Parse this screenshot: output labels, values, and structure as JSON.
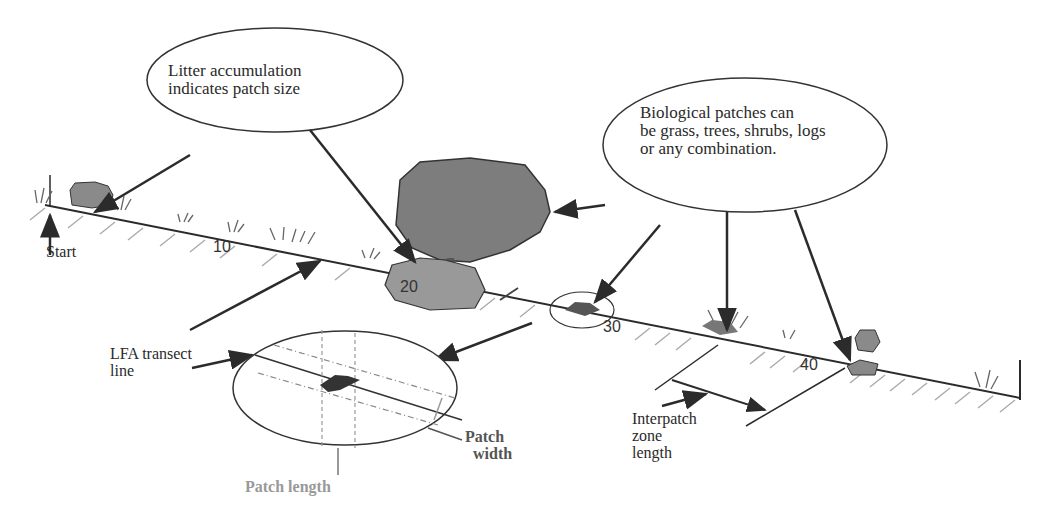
{
  "callouts": {
    "litter": {
      "line1": "Litter accumulation",
      "line2": "indicates patch size"
    },
    "biological": {
      "line1": "Biological patches can",
      "line2": "be grass, trees, shrubs, logs",
      "line3": "or any combination."
    }
  },
  "labels": {
    "start": "Start",
    "transect_line1": "LFA transect",
    "transect_line2": "line",
    "patch_length": "Patch length",
    "patch_width_1": "Patch",
    "patch_width_2": "width",
    "interpatch_1": "Interpatch",
    "interpatch_2": "zone",
    "interpatch_3": "length"
  },
  "ticks": [
    "10",
    "20",
    "30",
    "40"
  ],
  "colors": {
    "line": "#2b2b2b",
    "canopy": "#7d7d7d",
    "litter": "#999999",
    "hatch": "#aaaaaa",
    "grey_label": "#999999"
  }
}
